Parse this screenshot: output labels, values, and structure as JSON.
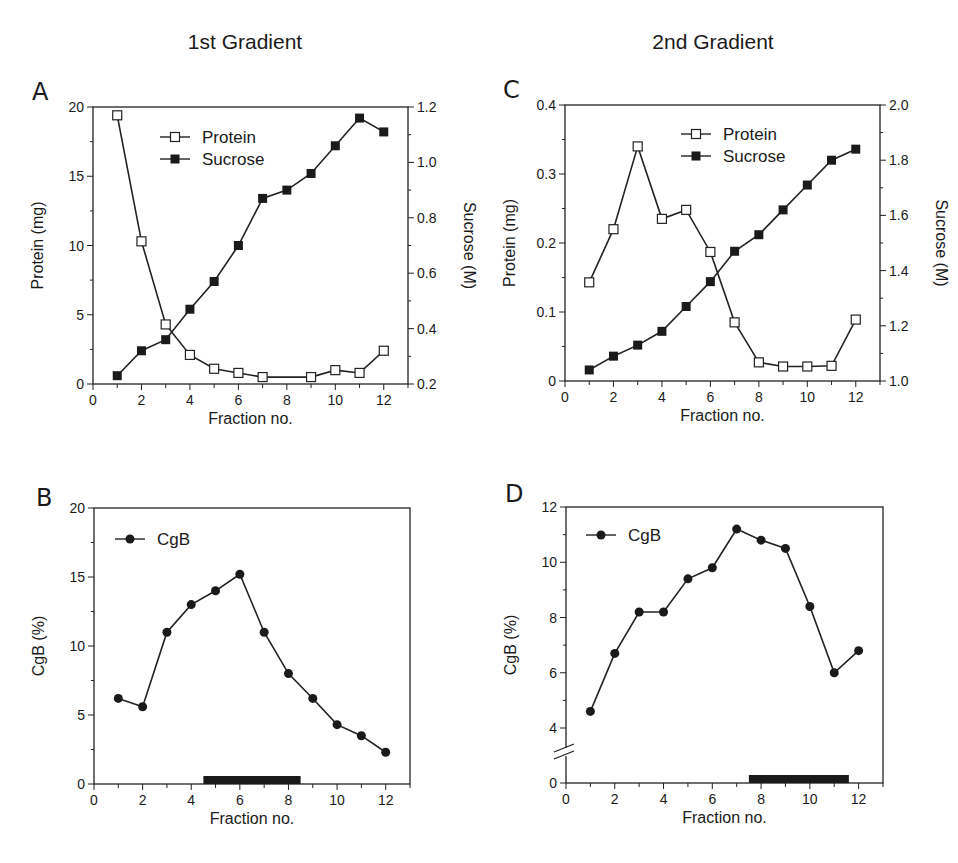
{
  "column_titles": [
    "1st Gradient",
    "2nd Gradient"
  ],
  "chart_data": [
    {
      "panel": "A",
      "type": "line",
      "xlabel": "Fraction no.",
      "ylabel": "Protein (mg)",
      "y2label": "Sucrose (M)",
      "xlim": [
        0,
        13
      ],
      "xticks": [
        0,
        2,
        4,
        6,
        8,
        10,
        12
      ],
      "ylim": [
        0,
        20
      ],
      "yticks": [
        0,
        5,
        10,
        15,
        20
      ],
      "y2lim": [
        0.2,
        1.2
      ],
      "y2ticks": [
        "0.2",
        "0.4",
        "0.6",
        "0.8",
        "1.0",
        "1.2"
      ],
      "legend": [
        "Protein",
        "Sucrose"
      ],
      "grid": false,
      "series": [
        {
          "name": "Protein",
          "axis": "left",
          "marker": "open-square",
          "x": [
            1,
            2,
            3,
            4,
            5,
            6,
            7,
            9,
            10,
            11,
            12
          ],
          "values": [
            19.4,
            10.3,
            4.3,
            2.1,
            1.1,
            0.8,
            0.5,
            0.5,
            1.0,
            0.8,
            2.4
          ]
        },
        {
          "name": "Sucrose",
          "axis": "right",
          "marker": "filled-square",
          "x": [
            1,
            2,
            3,
            4,
            5,
            6,
            7,
            8,
            9,
            10,
            11,
            12
          ],
          "values": [
            0.23,
            0.32,
            0.36,
            0.47,
            0.57,
            0.7,
            0.87,
            0.9,
            0.96,
            1.06,
            1.16,
            1.11
          ]
        }
      ]
    },
    {
      "panel": "B",
      "type": "line",
      "xlabel": "Fraction no.",
      "ylabel": "CgB (%)",
      "xlim": [
        0,
        13
      ],
      "xticks": [
        0,
        2,
        4,
        6,
        8,
        10,
        12
      ],
      "ylim": [
        0,
        20
      ],
      "yticks": [
        0,
        5,
        10,
        15,
        20
      ],
      "legend": [
        "CgB"
      ],
      "grid": false,
      "bar_annotation": {
        "x_start": 4.5,
        "x_end": 8.5
      },
      "series": [
        {
          "name": "CgB",
          "marker": "filled-circle",
          "x": [
            1,
            2,
            3,
            4,
            5,
            6,
            7,
            8,
            9,
            10,
            11,
            12
          ],
          "values": [
            6.2,
            5.6,
            11.0,
            13.0,
            14.0,
            15.2,
            11.0,
            8.0,
            6.2,
            4.3,
            3.5,
            2.3
          ]
        }
      ]
    },
    {
      "panel": "C",
      "type": "line",
      "xlabel": "Fraction no.",
      "ylabel": "Protein (mg)",
      "y2label": "Sucrose (M)",
      "xlim": [
        0,
        13
      ],
      "xticks": [
        0,
        2,
        4,
        6,
        8,
        10,
        12
      ],
      "ylim": [
        0,
        0.4
      ],
      "yticks": [
        "0",
        "0.1",
        "0.2",
        "0.3",
        "0.4"
      ],
      "y2lim": [
        1.0,
        2.0
      ],
      "y2ticks": [
        "1.0",
        "1.2",
        "1.4",
        "1.6",
        "1.8",
        "2.0"
      ],
      "legend": [
        "Protein",
        "Sucrose"
      ],
      "grid": false,
      "series": [
        {
          "name": "Protein",
          "axis": "left",
          "marker": "open-square",
          "x": [
            1,
            2,
            3,
            4,
            5,
            6,
            7,
            8,
            9,
            10,
            11,
            12
          ],
          "values": [
            0.143,
            0.22,
            0.34,
            0.235,
            0.248,
            0.187,
            0.085,
            0.027,
            0.021,
            0.021,
            0.022,
            0.089
          ]
        },
        {
          "name": "Sucrose",
          "axis": "right",
          "marker": "filled-square",
          "x": [
            1,
            2,
            3,
            4,
            5,
            6,
            7,
            8,
            9,
            10,
            11,
            12
          ],
          "values": [
            1.04,
            1.09,
            1.13,
            1.18,
            1.27,
            1.36,
            1.47,
            1.53,
            1.62,
            1.71,
            1.8,
            1.84
          ]
        }
      ]
    },
    {
      "panel": "D",
      "type": "line",
      "xlabel": "Fraction no.",
      "ylabel": "CgB (%)",
      "xlim": [
        0,
        13
      ],
      "xticks": [
        0,
        2,
        4,
        6,
        8,
        10,
        12
      ],
      "ylim": [
        0,
        12
      ],
      "yticks": [
        0,
        4,
        6,
        8,
        10,
        12
      ],
      "axis_break": "between 0 and 4",
      "legend": [
        "CgB"
      ],
      "grid": false,
      "bar_annotation": {
        "x_start": 7.5,
        "x_end": 11.6
      },
      "series": [
        {
          "name": "CgB",
          "marker": "filled-circle",
          "x": [
            1,
            2,
            3,
            4,
            5,
            6,
            7,
            8,
            9,
            10,
            11,
            12
          ],
          "values": [
            4.6,
            6.7,
            8.2,
            8.2,
            9.4,
            9.8,
            11.2,
            10.8,
            10.5,
            8.4,
            6.0,
            6.8
          ]
        }
      ]
    }
  ]
}
